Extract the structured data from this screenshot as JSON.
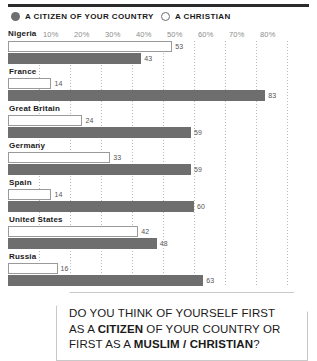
{
  "legend": {
    "items": [
      {
        "label": "A CITIZEN OF YOUR COUNTRY",
        "marker": "filled-circle-icon",
        "color": "#6e6e6e"
      },
      {
        "label": "A CHRISTIAN",
        "marker": "hollow-circle-icon",
        "color": "#ffffff"
      }
    ]
  },
  "caption": {
    "line1_a": "DO YOU THINK OF YOURSELF FIRST",
    "line2_a": "AS A ",
    "line2_b": "CITIZEN",
    "line2_c": " OF YOUR COUNTRY OR",
    "line3_a": "FIRST AS A ",
    "line3_b": "MUSLIM / CHRISTIAN",
    "line3_c": "?"
  },
  "chart_data": {
    "type": "bar",
    "orientation": "horizontal",
    "title": "",
    "xlabel": "",
    "ylabel": "",
    "xlim": [
      0,
      90
    ],
    "grid": true,
    "legend_position": "top",
    "tick_labels": [
      "10%",
      "20%",
      "30%",
      "40%",
      "50%",
      "60%",
      "70%",
      "80%"
    ],
    "tick_values": [
      10,
      20,
      30,
      40,
      50,
      60,
      70,
      80
    ],
    "first_group_header": "Nigeria",
    "categories": [
      "Nigeria",
      "France",
      "Great Britain",
      "Germany",
      "Spain",
      "United States",
      "Russia"
    ],
    "series": [
      {
        "name": "A CHRISTIAN",
        "style": "white",
        "values": [
          53,
          14,
          24,
          33,
          14,
          42,
          16
        ]
      },
      {
        "name": "A CITIZEN OF YOUR COUNTRY",
        "style": "gray",
        "values": [
          43,
          83,
          59,
          59,
          60,
          48,
          63
        ]
      }
    ]
  }
}
